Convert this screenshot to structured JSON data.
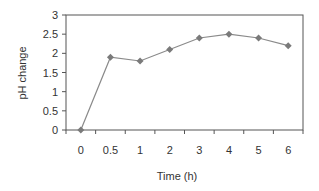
{
  "chart_data": {
    "type": "line",
    "title": "",
    "xlabel": "Time (h)",
    "ylabel": "pH change",
    "categories": [
      "0",
      "0.5",
      "1",
      "2",
      "3",
      "4",
      "5",
      "6"
    ],
    "series": [
      {
        "name": "pH change",
        "values": [
          0,
          1.9,
          1.8,
          2.1,
          2.4,
          2.5,
          2.4,
          2.2
        ]
      }
    ],
    "ylim": [
      0,
      3
    ],
    "yticks": [
      "0",
      "0.5",
      "1",
      "1.5",
      "2",
      "2.5",
      "3"
    ],
    "grid": false,
    "legend": "none",
    "marker": "diamond",
    "colors": {
      "line": "#8a8a8a",
      "marker": "#7a7a7a",
      "frame": "#555555",
      "text": "#333333"
    }
  }
}
